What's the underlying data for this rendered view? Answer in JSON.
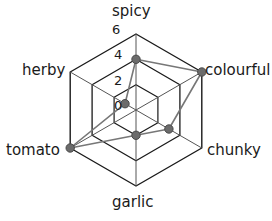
{
  "chart_data": {
    "type": "radar",
    "title": "",
    "categories": [
      "spicy",
      "colourful",
      "chunky",
      "garlic",
      "tomato",
      "herby"
    ],
    "values": [
      4,
      6,
      3,
      2,
      6,
      1
    ],
    "series": [
      {
        "name": "sauce profile",
        "values": [
          4,
          6,
          3,
          2,
          6,
          1
        ]
      }
    ],
    "tick_labels": [
      "0",
      "2",
      "4",
      "6"
    ],
    "tick_values": [
      0,
      2,
      4,
      6
    ],
    "rlim": [
      0,
      6
    ],
    "rings": [
      2,
      4,
      6
    ],
    "grid": true,
    "legend": false,
    "xlabel": "",
    "ylabel": "",
    "colors": {
      "grid_line": "#1a1a1a",
      "spoke_line": "#555555",
      "series_line": "#777777",
      "marker_fill": "#6b6b6b",
      "marker_stroke": "#4a4a4a",
      "background": "#ffffff",
      "text": "#1a1a1a"
    }
  },
  "axes": {
    "spicy": {
      "label": "spicy",
      "value": 4
    },
    "colourful": {
      "label": "colourful",
      "value": 6
    },
    "chunky": {
      "label": "chunky",
      "value": 3
    },
    "garlic": {
      "label": "garlic",
      "value": 2
    },
    "tomato": {
      "label": "tomato",
      "value": 6
    },
    "herby": {
      "label": "herby",
      "value": 1
    }
  },
  "ticks": {
    "t0": "0",
    "t2": "2",
    "t4": "4",
    "t6": "6"
  }
}
